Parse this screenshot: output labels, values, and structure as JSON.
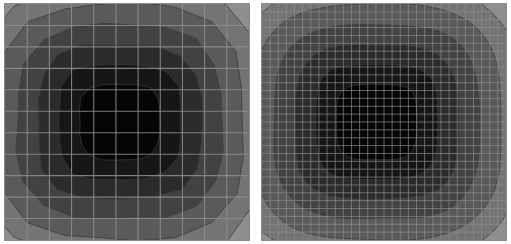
{
  "figure": {
    "title": "",
    "background": "#ffffff",
    "panel_count": 2
  },
  "panels": [
    {
      "id": "coarse",
      "name": "coarse-mesh-contour-plot",
      "position": "left",
      "grid_cells_x": 11,
      "grid_cells_y": 11,
      "grid_color": "#8f8f8f",
      "frame_color": "#8a8a8a",
      "background_color": "#e9e9e9",
      "contour_line_color": "#3a3a3a",
      "smoothness": "polygonal"
    },
    {
      "id": "fine",
      "name": "fine-mesh-contour-plot",
      "position": "right",
      "grid_cells_x": 30,
      "grid_cells_y": 30,
      "grid_color": "#8f8f8f",
      "frame_color": "#8a8a8a",
      "background_color": "#e9e9e9",
      "contour_line_color": "#3a3a3a",
      "smoothness": "smooth"
    }
  ],
  "chart_data": {
    "type": "heatmap",
    "title": "",
    "xlabel": "",
    "ylabel": "",
    "subtitle": "",
    "grid": true,
    "legend": "none",
    "annotations": [],
    "colormap": "grayscale-inverted",
    "xlim": [
      0,
      1
    ],
    "ylim": [
      0,
      1
    ],
    "xticks": [
      0,
      0.0909,
      0.1818,
      0.2727,
      0.3636,
      0.4545,
      0.5455,
      0.6364,
      0.7273,
      0.8182,
      0.9091,
      1
    ],
    "yticks": [
      0,
      0.0909,
      0.1818,
      0.2727,
      0.3636,
      0.4545,
      0.5455,
      0.6364,
      0.7273,
      0.8182,
      0.9091,
      1
    ],
    "xticklabels": [],
    "yticklabels": [],
    "center": [
      0.47,
      0.5
    ],
    "levels": [
      0.0,
      0.1,
      0.2,
      0.3,
      0.4,
      0.5,
      0.6,
      0.7,
      0.8,
      0.9,
      1.0
    ],
    "level_colors": [
      "#e9e9e9",
      "#d2d2d2",
      "#bdbdbd",
      "#a8a8a8",
      "#8e8e8e",
      "#747474",
      "#5a5a5a",
      "#424242",
      "#2b2b2b",
      "#161616",
      "#050505"
    ],
    "level_radii": [
      0.495,
      0.445,
      0.395,
      0.345,
      0.295,
      0.25,
      0.205,
      0.163,
      0.122,
      0.08
    ],
    "series": [
      {
        "name": "scalar-field",
        "values": [
          0.0,
          0.1,
          0.2,
          0.3,
          0.4,
          0.5,
          0.6,
          0.7,
          0.8,
          0.9,
          1.0
        ]
      }
    ]
  }
}
